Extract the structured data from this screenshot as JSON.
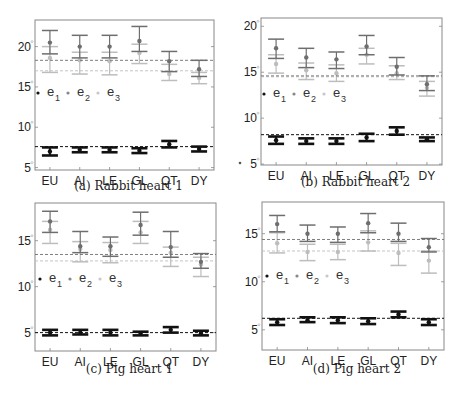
{
  "chart_data": [
    {
      "type": "errorbar",
      "title": "(a) Rabbit heart 1",
      "caption": "(a) Rabbit heart 1",
      "categories": [
        "EU",
        "AI",
        "LE",
        "GL",
        "QT",
        "DY"
      ],
      "yticks": [
        5,
        10,
        15,
        20
      ],
      "ylim": [
        4.7,
        23.3
      ],
      "legend": [
        "e1",
        "e2",
        "e3"
      ],
      "series": [
        {
          "name": "e1",
          "color": "#111111",
          "mean": [
            7.0,
            7.2,
            7.2,
            7.1,
            7.9,
            7.3
          ],
          "lower": [
            6.5,
            6.9,
            6.9,
            6.8,
            7.5,
            7.0
          ],
          "upper": [
            7.5,
            7.5,
            7.5,
            7.4,
            8.3,
            7.6
          ],
          "refline": 7.6
        },
        {
          "name": "e2",
          "color": "#6e6e6e",
          "mean": [
            20.5,
            20.0,
            20.0,
            20.7,
            18.2,
            17.2
          ],
          "lower": [
            19.1,
            18.6,
            18.6,
            19.4,
            16.9,
            16.3
          ],
          "upper": [
            22.0,
            21.4,
            21.4,
            22.5,
            19.4,
            18.3
          ],
          "refline": 18.3
        },
        {
          "name": "e3",
          "color": "#bdbdbd",
          "mean": [
            18.6,
            18.3,
            18.2,
            19.2,
            16.6,
            16.1
          ],
          "lower": [
            16.8,
            16.6,
            16.5,
            17.9,
            15.8,
            15.4
          ],
          "upper": [
            20.0,
            19.3,
            19.3,
            20.3,
            17.8,
            16.8
          ],
          "refline": 17.0
        }
      ]
    },
    {
      "type": "errorbar",
      "title": "(b) Rabbit heart 2",
      "caption": "(b) Rabbit heart 2",
      "categories": [
        "EU",
        "AI",
        "LE",
        "GL",
        "QT",
        "DY"
      ],
      "yticks": [
        5,
        10,
        15,
        20
      ],
      "ylim": [
        4.9,
        20.9
      ],
      "legend": [
        "e1",
        "e2",
        "e3"
      ],
      "series": [
        {
          "name": "e1",
          "color": "#111111",
          "mean": [
            7.6,
            7.5,
            7.5,
            7.9,
            8.6,
            7.7
          ],
          "lower": [
            7.2,
            7.2,
            7.2,
            7.5,
            8.2,
            7.5
          ],
          "upper": [
            8.0,
            7.8,
            7.8,
            8.3,
            9.0,
            7.9
          ],
          "refline": 8.2
        },
        {
          "name": "e2",
          "color": "#6e6e6e",
          "mean": [
            17.6,
            16.6,
            16.4,
            17.8,
            15.6,
            13.7
          ],
          "lower": [
            16.5,
            15.5,
            15.4,
            16.9,
            14.7,
            13.0
          ],
          "upper": [
            18.6,
            17.6,
            17.2,
            19.0,
            16.6,
            14.6
          ],
          "refline": 14.6
        },
        {
          "name": "e3",
          "color": "#bdbdbd",
          "mean": [
            15.9,
            15.2,
            14.9,
            16.9,
            14.9,
            13.3
          ],
          "lower": [
            14.9,
            14.2,
            14.0,
            15.9,
            14.2,
            12.4
          ],
          "upper": [
            16.9,
            16.0,
            15.8,
            17.6,
            15.7,
            14.0
          ],
          "refline": 14.5
        }
      ]
    },
    {
      "type": "errorbar",
      "title": "(c) Pig heart 1",
      "caption": "(c) Pig heart 1",
      "categories": [
        "EU",
        "AI",
        "LE",
        "GL",
        "QT",
        "DY"
      ],
      "yticks": [
        5,
        10,
        15
      ],
      "ylim": [
        3.0,
        19.1
      ],
      "legend": [
        "e1",
        "e2",
        "e3"
      ],
      "series": [
        {
          "name": "e1",
          "color": "#111111",
          "mean": [
            5.0,
            5.0,
            5.0,
            4.9,
            5.3,
            4.9
          ],
          "lower": [
            4.7,
            4.8,
            4.7,
            4.7,
            5.0,
            4.7
          ],
          "upper": [
            5.3,
            5.3,
            5.3,
            5.1,
            5.6,
            5.2
          ],
          "refline": 5.0
        },
        {
          "name": "e2",
          "color": "#6e6e6e",
          "mean": [
            17.1,
            14.4,
            14.4,
            16.7,
            14.3,
            12.7
          ],
          "lower": [
            15.9,
            13.7,
            13.3,
            15.6,
            13.2,
            12.0
          ],
          "upper": [
            18.2,
            16.0,
            15.4,
            18.1,
            16.0,
            13.6
          ],
          "refline": 13.5
        },
        {
          "name": "e3",
          "color": "#bdbdbd",
          "mean": [
            16.2,
            14.1,
            14.0,
            15.9,
            13.7,
            12.4
          ],
          "lower": [
            14.7,
            12.7,
            12.6,
            14.7,
            12.2,
            11.1
          ],
          "upper": [
            17.1,
            14.9,
            14.8,
            17.1,
            14.3,
            13.2
          ],
          "refline": 12.8
        }
      ]
    },
    {
      "type": "errorbar",
      "title": "(d) Pig heart 2",
      "caption": "(d) Pig heart 2",
      "categories": [
        "EU",
        "AI",
        "LE",
        "GL",
        "QT",
        "DY"
      ],
      "yticks": [
        5,
        10,
        15
      ],
      "ylim": [
        2.9,
        18.3
      ],
      "legend": [
        "e1",
        "e2",
        "e3"
      ],
      "series": [
        {
          "name": "e1",
          "color": "#111111",
          "mean": [
            5.8,
            6.0,
            6.0,
            5.9,
            6.6,
            5.8
          ],
          "lower": [
            5.5,
            5.8,
            5.7,
            5.6,
            6.3,
            5.5
          ],
          "upper": [
            6.1,
            6.3,
            6.3,
            6.2,
            6.9,
            6.1
          ],
          "refline": 6.2
        },
        {
          "name": "e2",
          "color": "#6e6e6e",
          "mean": [
            16.0,
            15.0,
            15.0,
            16.1,
            15.0,
            13.6
          ],
          "lower": [
            15.2,
            14.2,
            14.1,
            15.1,
            14.2,
            13.1
          ],
          "upper": [
            16.9,
            15.9,
            15.7,
            17.1,
            16.1,
            14.5
          ],
          "refline": 14.4
        },
        {
          "name": "e3",
          "color": "#bdbdbd",
          "mean": [
            14.0,
            13.1,
            13.1,
            14.1,
            13.0,
            12.2
          ],
          "lower": [
            13.0,
            12.2,
            12.3,
            13.2,
            11.7,
            10.9
          ],
          "upper": [
            15.1,
            13.9,
            13.9,
            15.3,
            14.0,
            13.2
          ],
          "refline": 13.2
        }
      ]
    }
  ],
  "panels": [
    {
      "caption": "(a) Rabbit heart 1"
    },
    {
      "caption": "(b) Rabbit heart 2"
    },
    {
      "caption": "(c) Pig heart 1"
    },
    {
      "caption": "(d) Pig heart 2"
    }
  ],
  "legend": {
    "e1": "e",
    "e1_sub": "1",
    "e2": "e",
    "e2_sub": "2",
    "e3": "e",
    "e3_sub": "3"
  }
}
